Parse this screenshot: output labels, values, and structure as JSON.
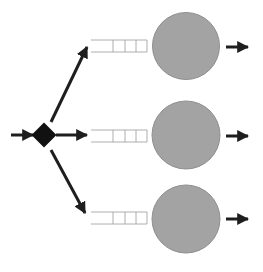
{
  "diagram": {
    "title": "",
    "type": "queueing-network-fork",
    "colors": {
      "background": "#ffffff",
      "arrow": "#1e1e1e",
      "router": "#111111",
      "server_fill": "#a3a3a3",
      "server_stroke": "#8f8f8f",
      "queue_stroke": "#9a9a9a"
    },
    "input_arrow": {
      "x1": 11,
      "y1": 135,
      "x2": 33,
      "y2": 135
    },
    "router": {
      "shape": "diamond",
      "cx": 44,
      "cy": 135,
      "half": 12.5
    },
    "branches": [
      {
        "name": "upper",
        "route_arrow": {
          "x1": 51,
          "y1": 122,
          "x2": 87,
          "y2": 47
        },
        "queue": {
          "x": 91,
          "y": 40,
          "w": 56,
          "h": 12,
          "slots": 4,
          "dividers": [
            113,
            125,
            136
          ]
        },
        "server": {
          "cx": 186,
          "cy": 46,
          "r": 33.5
        },
        "output_arrow": {
          "x1": 226,
          "y1": 47,
          "x2": 248,
          "y2": 47
        }
      },
      {
        "name": "middle",
        "route_arrow": {
          "x1": 56,
          "y1": 135,
          "x2": 87,
          "y2": 135
        },
        "queue": {
          "x": 91,
          "y": 130,
          "w": 56,
          "h": 12,
          "slots": 4,
          "dividers": [
            113,
            125,
            136
          ]
        },
        "server": {
          "cx": 186,
          "cy": 135,
          "r": 34
        },
        "output_arrow": {
          "x1": 226,
          "y1": 136,
          "x2": 248,
          "y2": 136
        }
      },
      {
        "name": "lower",
        "route_arrow": {
          "x1": 51,
          "y1": 150,
          "x2": 85,
          "y2": 213
        },
        "queue": {
          "x": 91,
          "y": 212,
          "w": 56,
          "h": 12,
          "slots": 4,
          "dividers": [
            113,
            125,
            136
          ]
        },
        "server": {
          "cx": 186,
          "cy": 219,
          "r": 34
        },
        "output_arrow": {
          "x1": 226,
          "y1": 219,
          "x2": 248,
          "y2": 219
        }
      }
    ]
  }
}
